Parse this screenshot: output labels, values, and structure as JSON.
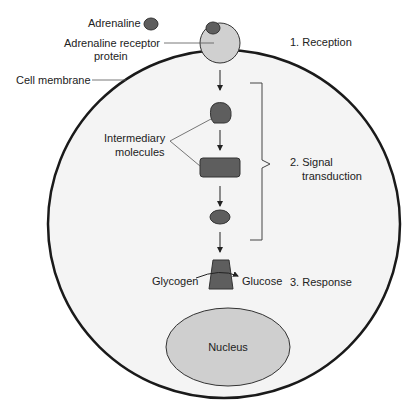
{
  "diagram": {
    "labels": {
      "adrenaline": "Adrenaline",
      "receptor_line1": "Adrenaline receptor",
      "receptor_line2": "protein",
      "cell_membrane": "Cell membrane",
      "intermediary_line1": "Intermediary",
      "intermediary_line2": "molecules",
      "glycogen": "Glycogen",
      "glucose": "Glucose",
      "nucleus": "Nucleus"
    },
    "stages": [
      {
        "label": "1. Reception"
      },
      {
        "label_line1": "2. Signal",
        "label_line2": "transduction"
      },
      {
        "label": "3. Response"
      }
    ],
    "colors": {
      "cell_fill": "#f4f4f4",
      "membrane": "#1a1a1a",
      "receptor_fill": "#d0d0d0",
      "molecule_fill": "#5e5e5e",
      "nucleus_fill": "#cfcfcf",
      "text": "#222222"
    }
  }
}
